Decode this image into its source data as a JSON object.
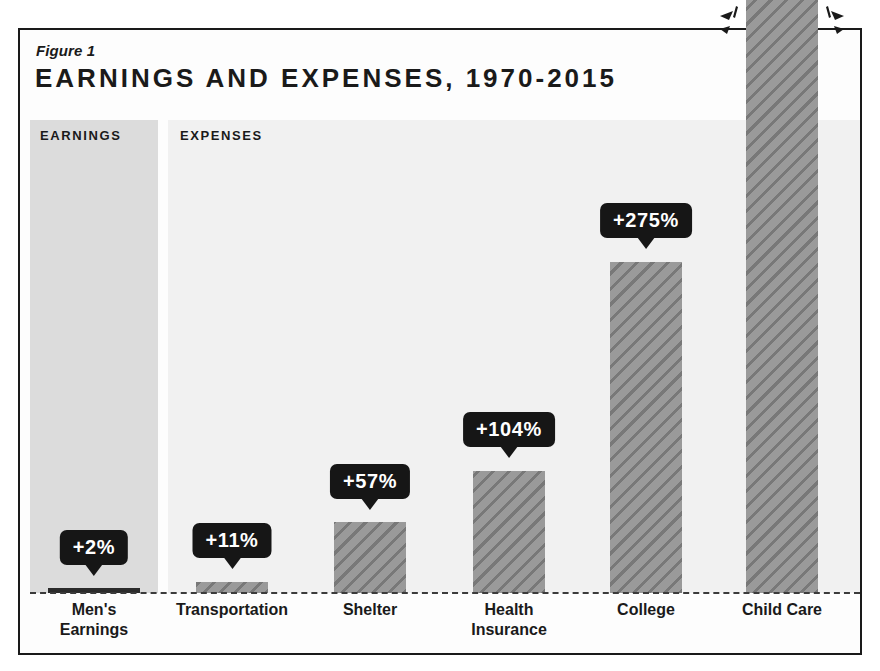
{
  "figure": {
    "number": "Figure 1",
    "title": "EARNINGS AND EXPENSES, 1970-2015"
  },
  "panels": {
    "earnings_label": "EARNINGS",
    "expenses_label": "EXPENSES"
  },
  "colors": {
    "frame": "#1a1a1a",
    "callout_bg": "#161616",
    "callout_text": "#ffffff",
    "bar_fill": "#9a9a9a",
    "bar_earnings_fill": "#2b2b2b",
    "earnings_panel_bg": "#dcdcdc",
    "expenses_panel_bg": "#f1f1f1",
    "baseline": "#3b3b3b"
  },
  "chart_data": {
    "type": "bar",
    "title": "EARNINGS AND EXPENSES, 1970-2015",
    "subtitle": "Figure 1",
    "xlabel": "",
    "ylabel": "",
    "grid": false,
    "legend": "none",
    "axis_note": "Child Care bar exceeds the top of the plot area (value truncated / breaks frame)",
    "groups": [
      {
        "name": "EARNINGS",
        "categories": [
          "Men's Earnings"
        ]
      },
      {
        "name": "EXPENSES",
        "categories": [
          "Transportation",
          "Shelter",
          "Health Insurance",
          "College",
          "Child Care"
        ]
      }
    ],
    "categories": [
      "Men's\nEarnings",
      "Transportation",
      "Shelter",
      "Health\nInsurance",
      "College",
      "Child Care"
    ],
    "values": [
      2,
      11,
      57,
      104,
      275,
      2000
    ],
    "value_labels": [
      "+2%",
      "+11%",
      "+57%",
      "+104%",
      "+275%",
      ""
    ],
    "bars": [
      {
        "category": "Men's\nEarnings",
        "group": "EARNINGS",
        "value": 2,
        "label": "+2%",
        "bar_px": {
          "left": 48,
          "width": 92,
          "height": 5
        },
        "callout_px": {
          "center_x": 94,
          "top": 530
        },
        "label_px": {
          "center_x": 94
        },
        "style": "solid-dark",
        "overflow": false
      },
      {
        "category": "Transportation",
        "group": "EXPENSES",
        "value": 11,
        "label": "+11%",
        "bar_px": {
          "left": 196,
          "width": 72,
          "height": 11
        },
        "callout_px": {
          "center_x": 232,
          "top": 523
        },
        "label_px": {
          "center_x": 232
        },
        "style": "hatched",
        "overflow": false
      },
      {
        "category": "Shelter",
        "group": "EXPENSES",
        "value": 57,
        "label": "+57%",
        "bar_px": {
          "left": 334,
          "width": 72,
          "height": 71
        },
        "callout_px": {
          "center_x": 370,
          "top": 464
        },
        "label_px": {
          "center_x": 370
        },
        "style": "hatched",
        "overflow": false
      },
      {
        "category": "Health\nInsurance",
        "group": "EXPENSES",
        "value": 104,
        "label": "+104%",
        "bar_px": {
          "left": 473,
          "width": 72,
          "height": 122
        },
        "callout_px": {
          "center_x": 509,
          "top": 412
        },
        "label_px": {
          "center_x": 509
        },
        "style": "hatched",
        "overflow": false
      },
      {
        "category": "College",
        "group": "EXPENSES",
        "value": 275,
        "label": "+275%",
        "bar_px": {
          "left": 610,
          "width": 72,
          "height": 331
        },
        "callout_px": {
          "center_x": 646,
          "top": 203
        },
        "label_px": {
          "center_x": 646
        },
        "style": "hatched",
        "overflow": false
      },
      {
        "category": "Child Care",
        "group": "EXPENSES",
        "value": null,
        "label": "",
        "bar_px": {
          "left": 746,
          "width": 72,
          "height": 593
        },
        "callout_px": null,
        "label_px": {
          "center_x": 782
        },
        "style": "hatched",
        "overflow": true
      }
    ]
  },
  "decorations": {
    "burst_left_name": "burst-mark-left",
    "burst_right_name": "burst-mark-right"
  }
}
